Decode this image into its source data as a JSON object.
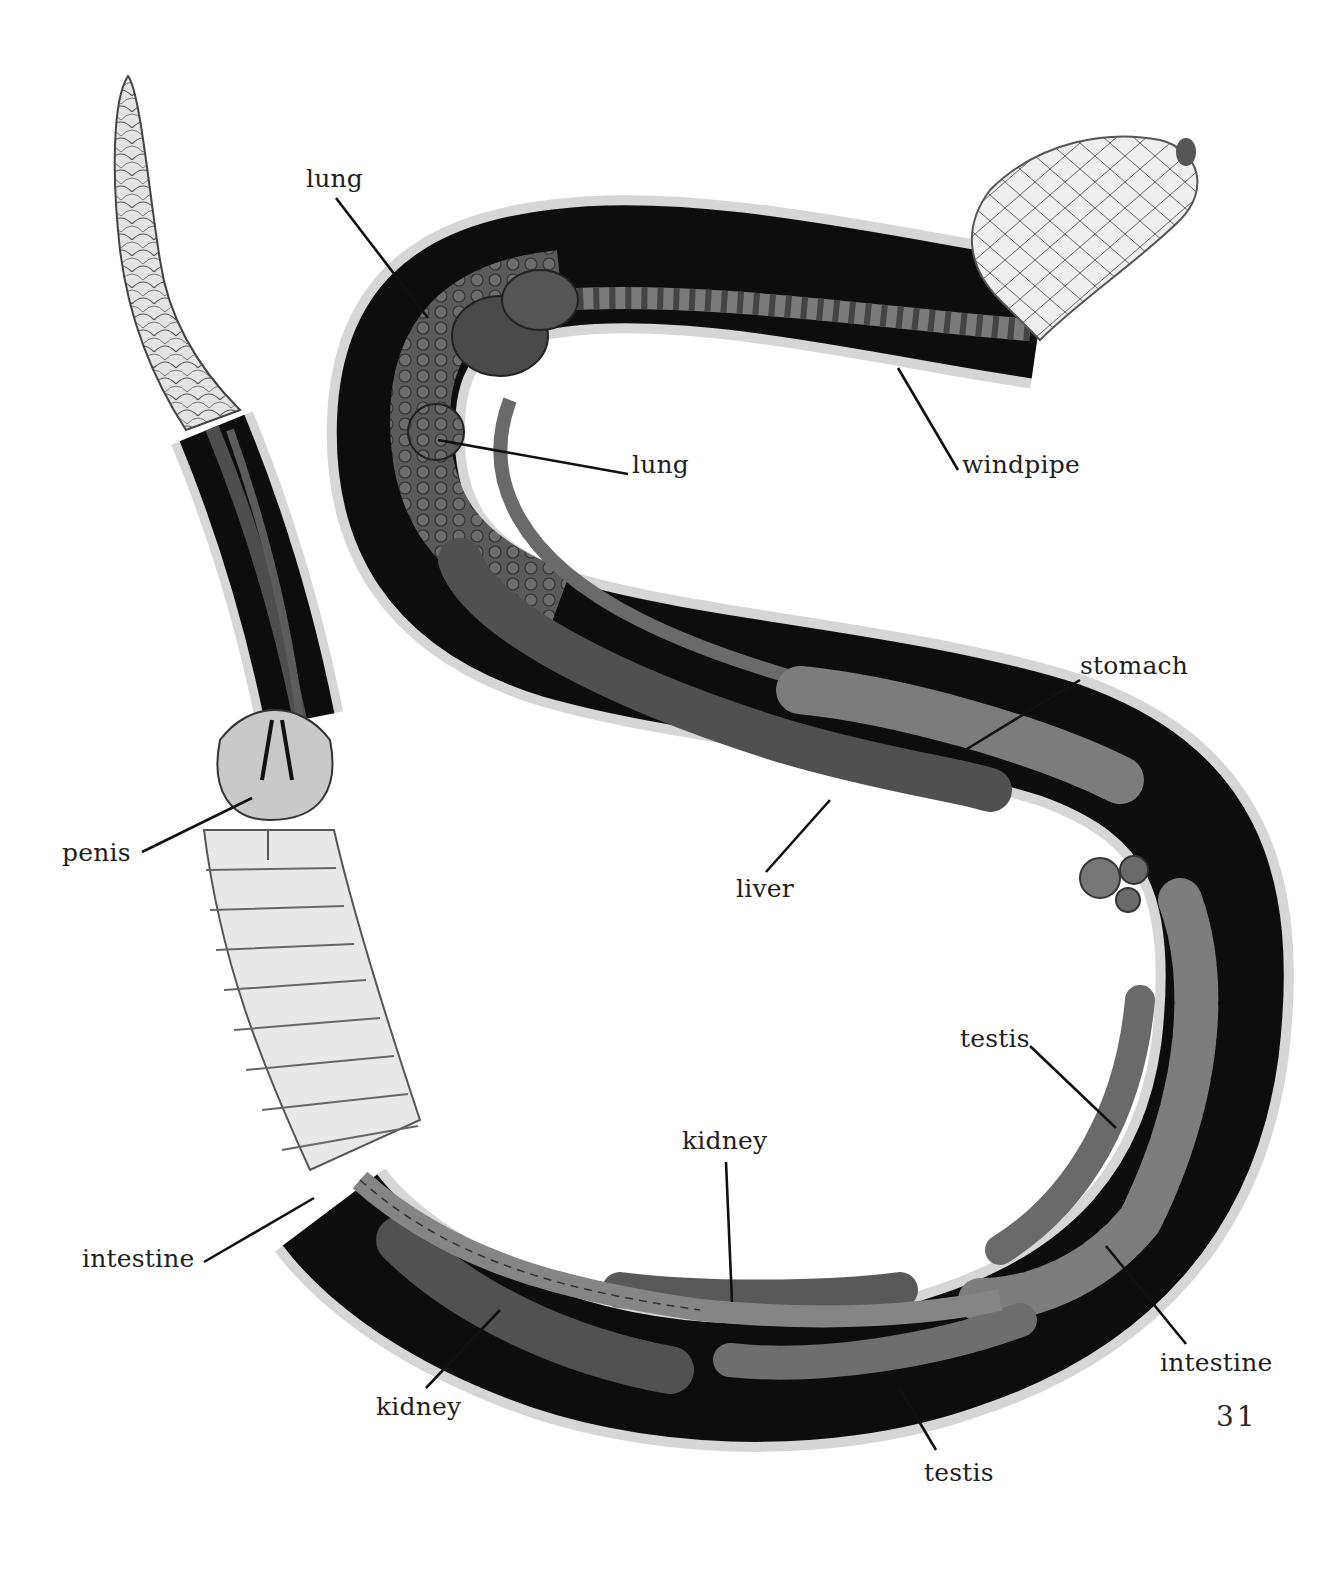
{
  "figure": {
    "colors": {
      "background": "#ffffff",
      "body_cavity": "#0d0d0d",
      "organ_dark": "#4a4a4a",
      "organ_mid": "#6e6e6e",
      "organ_light": "#8c8c8c",
      "skin_scales": "#d9d9d9",
      "belly_scales": "#e6e6e6",
      "label_text": "#1e1e1e",
      "leader_line": "#111111"
    }
  },
  "labels": [
    {
      "id": "lung-upper",
      "text": "lung",
      "x": 306,
      "y": 166,
      "line": [
        336,
        198,
        428,
        318
      ]
    },
    {
      "id": "lung-lower",
      "text": "lung",
      "x": 632,
      "y": 452,
      "line": [
        628,
        474,
        438,
        440
      ]
    },
    {
      "id": "windpipe",
      "text": "windpipe",
      "x": 962,
      "y": 452,
      "line": [
        958,
        470,
        898,
        368
      ]
    },
    {
      "id": "stomach",
      "text": "stomach",
      "x": 1080,
      "y": 653,
      "line": [
        1080,
        680,
        962,
        752
      ]
    },
    {
      "id": "liver",
      "text": "liver",
      "x": 736,
      "y": 876,
      "line": [
        766,
        872,
        830,
        800
      ]
    },
    {
      "id": "penis",
      "text": "penis",
      "x": 62,
      "y": 840,
      "line": [
        142,
        852,
        252,
        798
      ]
    },
    {
      "id": "testis-upper",
      "text": "testis",
      "x": 960,
      "y": 1026,
      "line": [
        1030,
        1046,
        1116,
        1128
      ]
    },
    {
      "id": "kidney-upper",
      "text": "kidney",
      "x": 682,
      "y": 1128,
      "line": [
        726,
        1162,
        732,
        1302
      ]
    },
    {
      "id": "intestine-left",
      "text": "intestine",
      "x": 82,
      "y": 1246,
      "line": [
        204,
        1262,
        314,
        1198
      ]
    },
    {
      "id": "kidney-lower",
      "text": "kidney",
      "x": 376,
      "y": 1394,
      "line": [
        426,
        1388,
        500,
        1310
      ]
    },
    {
      "id": "intestine-right",
      "text": "intestine",
      "x": 1160,
      "y": 1350,
      "line": [
        1186,
        1344,
        1106,
        1246
      ]
    },
    {
      "id": "testis-lower",
      "text": "testis",
      "x": 924,
      "y": 1460,
      "line": [
        936,
        1450,
        898,
        1386
      ]
    }
  ],
  "page": {
    "number": "31"
  }
}
